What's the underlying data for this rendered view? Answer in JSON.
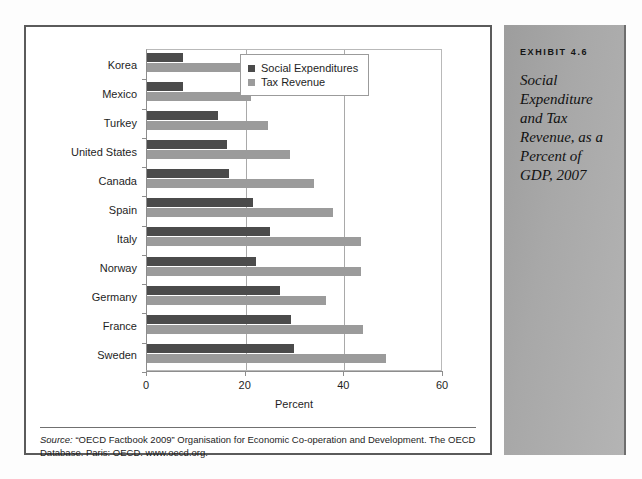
{
  "sidebar": {
    "kicker": "EXHIBIT 4.6",
    "title": "Social Expenditure and Tax Revenue, as a Percent of GDP, 2007"
  },
  "source": {
    "label": "Source:",
    "text": " “OECD Factbook 2009” Organisation for Economic Co-operation and Development. The OECD Database. Paris: OECD. www.oecd.org."
  },
  "legend": {
    "items": [
      {
        "label": "Social Expenditures",
        "color": "#4b4b4b"
      },
      {
        "label": "Tax Revenue",
        "color": "#9b9b9b"
      }
    ]
  },
  "chart_data": {
    "type": "bar",
    "orientation": "horizontal",
    "title": "",
    "xlabel": "Percent",
    "ylabel": "",
    "xlim": [
      0,
      60
    ],
    "xticks": [
      0,
      20,
      40,
      60
    ],
    "xtick_labels": [
      "0",
      "20",
      "40",
      "60"
    ],
    "grid": true,
    "grid_axis": "x",
    "legend_position": "top-right-inside",
    "categories": [
      "Korea",
      "Mexico",
      "Turkey",
      "United States",
      "Canada",
      "Spain",
      "Italy",
      "Norway",
      "Germany",
      "France",
      "Sweden"
    ],
    "series": [
      {
        "name": "Social Expenditures",
        "color": "#4b4b4b",
        "values": [
          7.3,
          7.3,
          14.4,
          16.2,
          16.6,
          21.5,
          25.0,
          22.0,
          27.0,
          29.2,
          29.8
        ]
      },
      {
        "name": "Tax Revenue",
        "color": "#9b9b9b",
        "values": [
          29.0,
          21.0,
          24.5,
          29.0,
          33.8,
          37.7,
          43.4,
          43.4,
          36.3,
          43.8,
          48.5
        ]
      }
    ]
  }
}
